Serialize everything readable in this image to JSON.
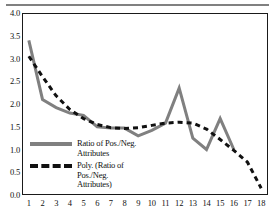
{
  "chart_data": {
    "type": "line",
    "title": "",
    "xlabel": "",
    "ylabel": "",
    "xlim": [
      1,
      18
    ],
    "ylim": [
      0.0,
      4.0
    ],
    "grid": false,
    "legend_position": "inside-lower-left",
    "categories": [
      1,
      2,
      3,
      4,
      5,
      6,
      7,
      8,
      9,
      10,
      11,
      12,
      13,
      14,
      15,
      16,
      17,
      18
    ],
    "xtick_labels": [
      "1",
      "2",
      "3",
      "4",
      "5",
      "6",
      "7",
      "8",
      "9",
      "10",
      "11",
      "12",
      "13",
      "14",
      "15",
      "16",
      "17",
      "18"
    ],
    "ytick_labels": [
      "4.0",
      "3.5",
      "3.0",
      "2.5",
      "2.0",
      "1.5",
      "1.0",
      "0.5",
      "0.0"
    ],
    "ytick_values": [
      4.0,
      3.5,
      3.0,
      2.5,
      2.0,
      1.5,
      1.0,
      0.5,
      0.0
    ],
    "series": [
      {
        "name": "Ratio of Pos./Neg. Attributes",
        "style": "solid",
        "color": "#808080",
        "width": 3,
        "x": [
          1,
          2,
          3,
          4,
          5,
          6,
          7,
          8,
          9,
          10,
          11,
          12,
          13,
          14,
          15,
          16
        ],
        "values": [
          3.4,
          2.1,
          1.92,
          1.8,
          1.75,
          1.5,
          1.47,
          1.47,
          1.3,
          1.42,
          1.58,
          2.35,
          1.25,
          1.0,
          1.68,
          1.0
        ]
      },
      {
        "name": "Poly. (Ratio of Pos./Neg. Attributes)",
        "style": "dashed",
        "color": "#111111",
        "width": 3,
        "x": [
          1,
          2,
          3,
          4,
          5,
          6,
          7,
          8,
          9,
          10,
          11,
          12,
          13,
          14,
          15,
          16,
          17,
          18
        ],
        "values": [
          3.05,
          2.6,
          2.18,
          1.88,
          1.68,
          1.55,
          1.48,
          1.46,
          1.48,
          1.53,
          1.58,
          1.6,
          1.58,
          1.45,
          1.22,
          0.98,
          0.72,
          0.15
        ]
      }
    ],
    "legend_entries": [
      {
        "label": "Ratio of Pos./Neg.\nAttributes",
        "style": "solid",
        "color": "#808080"
      },
      {
        "label": "Poly. (Ratio of\nPos./Neg.\nAttributes)",
        "style": "dashed",
        "color": "#111111"
      }
    ]
  },
  "axes": {
    "frame_color": "#1a1a1a",
    "top_rule_color": "#808080"
  }
}
